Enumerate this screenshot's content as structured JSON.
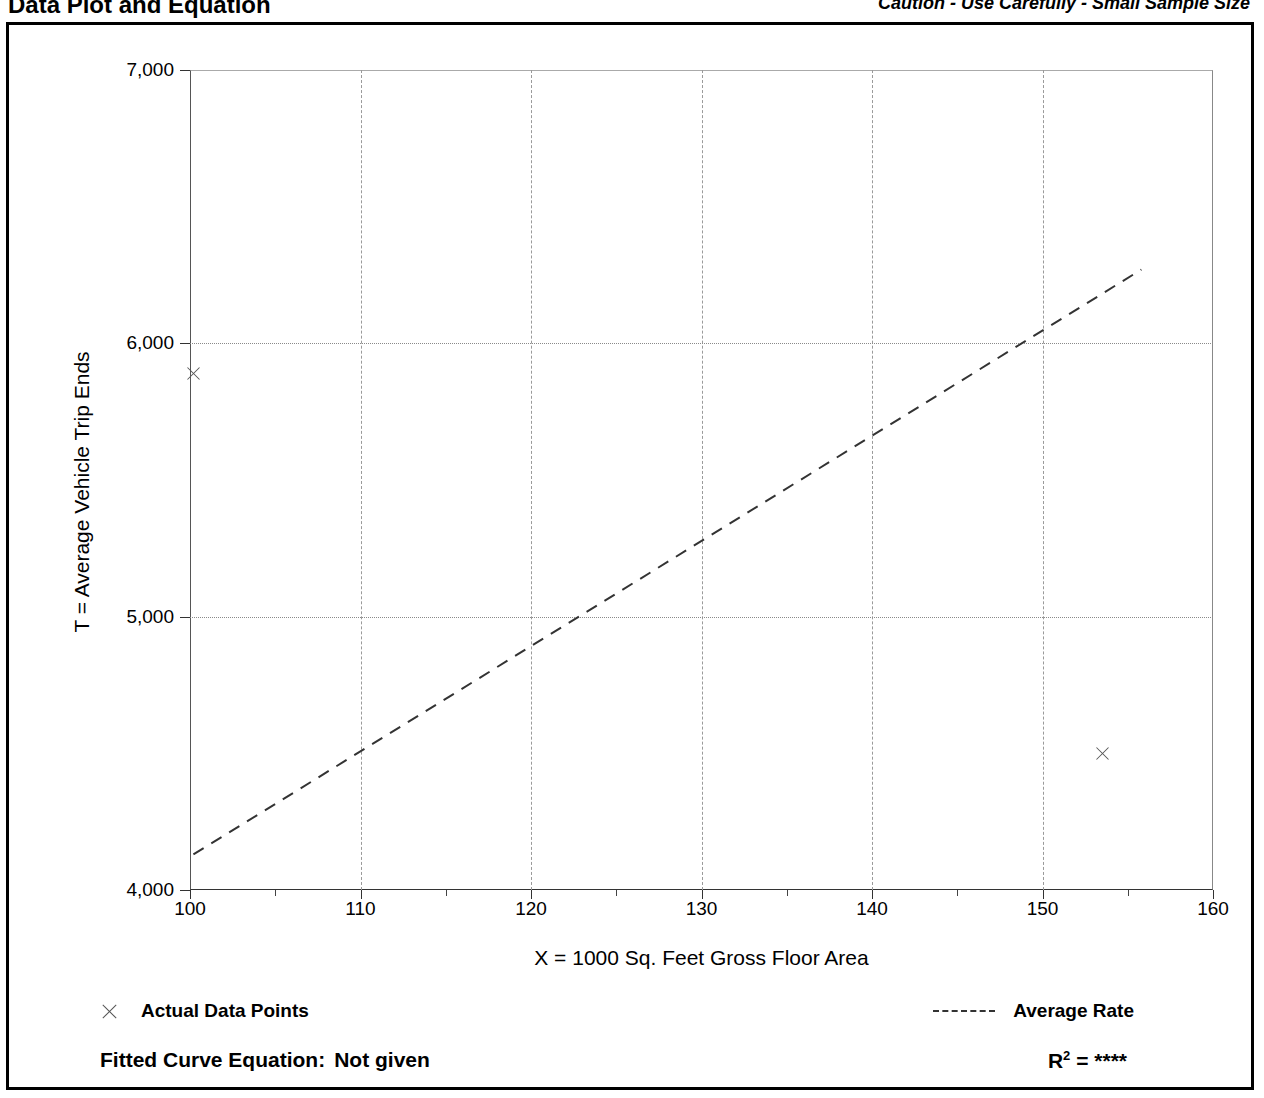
{
  "header": {
    "title": "Data Plot and Equation",
    "caution": "Caution - Use Carefully - Small Sample Size"
  },
  "legend": {
    "data_points_label": "Actual Data Points",
    "average_rate_label": "Average Rate",
    "data_points_marker": "x-cross-marker",
    "average_rate_marker": "dashed-line-swatch"
  },
  "equation": {
    "fitted_curve_label": "Fitted Curve Equation:",
    "fitted_curve_value": "Not given",
    "r_symbol": "R",
    "r_exponent": "2",
    "r_equals": "=",
    "r_value": "****"
  },
  "chart_data": {
    "type": "scatter",
    "title": "Data Plot and Equation",
    "subtitle": "Caution - Use Carefully - Small Sample Size",
    "xlabel": "X = 1000 Sq. Feet Gross Floor Area",
    "ylabel": "T = Average Vehicle Trip Ends",
    "xlim": [
      100,
      160
    ],
    "ylim": [
      4000,
      7000
    ],
    "xticks": [
      100,
      110,
      120,
      130,
      140,
      150,
      160
    ],
    "xticklabels": [
      "100",
      "110",
      "120",
      "130",
      "140",
      "150",
      "160"
    ],
    "xminor_ticks": [
      105,
      115,
      125,
      135,
      145,
      155
    ],
    "yticks": [
      4000,
      5000,
      6000,
      7000
    ],
    "yticklabels": [
      "4,000",
      "5,000",
      "6,000",
      "7,000"
    ],
    "grid": true,
    "grid_x_values": [
      110,
      120,
      130,
      140,
      150
    ],
    "grid_y_values": [
      5000,
      6000
    ],
    "legend_position": "below-axes",
    "series": [
      {
        "name": "Actual Data Points",
        "type": "scatter",
        "marker": "x",
        "points": [
          {
            "x": 100.2,
            "y": 5890
          },
          {
            "x": 153.5,
            "y": 4500
          }
        ]
      },
      {
        "name": "Average Rate",
        "type": "line",
        "linestyle": "dashed",
        "x": [
          100.2,
          155.8
        ],
        "y": [
          4130,
          6270
        ]
      }
    ]
  },
  "axes_geometry": {
    "plot_left_px": 190,
    "plot_top_px": 70,
    "plot_width_px": 1023,
    "plot_height_px": 820
  }
}
